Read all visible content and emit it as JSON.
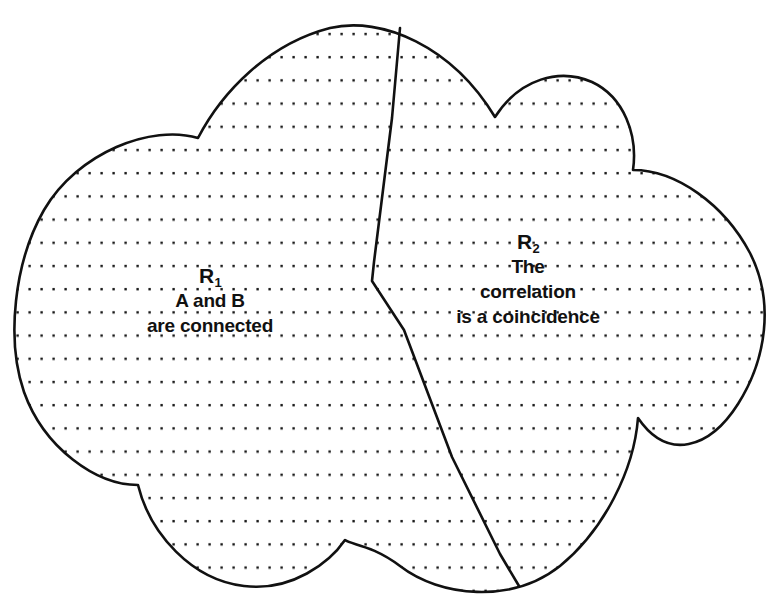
{
  "diagram": {
    "shape_name": "cloud",
    "outline_color": "#111111",
    "fill_pattern": "dotted",
    "dot_color": "#1a1a1a",
    "background_color": "#ffffff",
    "divider": {
      "name": "region-divider-line",
      "description": "irregular line splitting the cloud into R1 and R2"
    },
    "regions": [
      {
        "id": "R1",
        "symbol": "R",
        "subscript": "1",
        "lines": [
          "A and B",
          "are connected"
        ]
      },
      {
        "id": "R2",
        "symbol": "R",
        "subscript": "2",
        "lines": [
          "The",
          "correlation",
          "is a  coincidence"
        ]
      }
    ]
  }
}
